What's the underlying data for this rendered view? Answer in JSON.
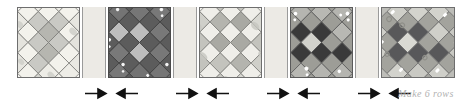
{
  "diagram": {
    "type": "quilt-row-assembly-diagram",
    "background_color": "#ffffff",
    "annotation": {
      "text": "Make 6 rows",
      "color": "#b2b2b2"
    },
    "blocks": [
      {
        "index": 1,
        "name": "block-1",
        "x": 17,
        "y": 7,
        "width": 63,
        "height": 71,
        "tone": "very-light",
        "background_color": "#f7f6f2",
        "patch_light": "#f3f2ec",
        "patch_mid": "#c9c9c4",
        "patch_dark": "#b6b6b0",
        "outline_color": "#6e6e6e",
        "center_accent": "medium-grey-pinwheel"
      },
      {
        "index": 2,
        "name": "block-2",
        "x": 108,
        "y": 7,
        "width": 63,
        "height": 71,
        "tone": "dark",
        "background_color": "#6b6b6b",
        "patch_light": "#bdbdbd",
        "patch_mid": "#7a7a7a",
        "patch_dark": "#5c5c5c",
        "outline_color": "#4a4a4a",
        "center_accent": "light-grey-square"
      },
      {
        "index": 3,
        "name": "block-3",
        "x": 199,
        "y": 7,
        "width": 63,
        "height": 71,
        "tone": "light",
        "background_color": "#f0efeb",
        "patch_light": "#efeee9",
        "patch_mid": "#c3c3bd",
        "patch_dark": "#a9a9a3",
        "outline_color": "#6e6e6e",
        "center_accent": "medium-grey-cluster"
      },
      {
        "index": 4,
        "name": "block-4",
        "x": 290,
        "y": 7,
        "width": 63,
        "height": 71,
        "tone": "medium-dark",
        "background_color": "#a9a9a4",
        "patch_light": "#d2d2cc",
        "patch_mid": "#9d9d97",
        "patch_dark": "#3a3a3a",
        "outline_color": "#5a5a5a",
        "center_accent": "dark-checkerboard"
      },
      {
        "index": 5,
        "name": "block-5",
        "x": 381,
        "y": 7,
        "width": 74,
        "height": 71,
        "tone": "medium",
        "background_color": "#bdbdb8",
        "patch_light": "#d9d9d3",
        "patch_mid": "#a3a39d",
        "patch_dark": "#58585a",
        "outline_color": "#6e6e6e",
        "center_accent": "dark-grey-checkerboard"
      }
    ],
    "sashings": [
      {
        "name": "sashing-1",
        "x": 82,
        "y": 7,
        "width": 24,
        "height": 71,
        "color": "#eceae5"
      },
      {
        "name": "sashing-2",
        "x": 173,
        "y": 7,
        "width": 24,
        "height": 71,
        "color": "#eceae5"
      },
      {
        "name": "sashing-3",
        "x": 264,
        "y": 7,
        "width": 24,
        "height": 71,
        "color": "#eceae5"
      },
      {
        "name": "sashing-4",
        "x": 355,
        "y": 7,
        "width": 24,
        "height": 71,
        "color": "#eceae5"
      }
    ],
    "arrows": [
      {
        "name": "arrow-right-1",
        "direction": "right",
        "x": 84,
        "y": 87
      },
      {
        "name": "arrow-left-1",
        "direction": "left",
        "x": 113,
        "y": 87
      },
      {
        "name": "arrow-right-2",
        "direction": "right",
        "x": 175,
        "y": 87
      },
      {
        "name": "arrow-left-2",
        "direction": "left",
        "x": 204,
        "y": 87
      },
      {
        "name": "arrow-right-3",
        "direction": "right",
        "x": 266,
        "y": 87
      },
      {
        "name": "arrow-left-3",
        "direction": "left",
        "x": 295,
        "y": 87
      },
      {
        "name": "arrow-right-4",
        "direction": "right",
        "x": 357,
        "y": 87
      },
      {
        "name": "arrow-left-4",
        "direction": "left",
        "x": 386,
        "y": 87
      }
    ]
  }
}
